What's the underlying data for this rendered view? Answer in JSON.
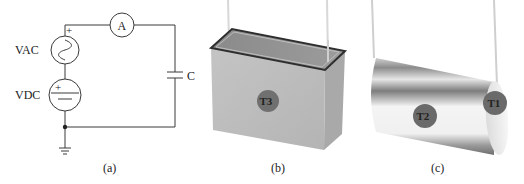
{
  "figure": {
    "panels": [
      {
        "id": "a",
        "caption": "(a)",
        "description": "circuit schematic",
        "labels": {
          "vac": "VAC",
          "vdc": "VDC",
          "ammeter": "A",
          "capacitor": "C",
          "vac_polarity": "+",
          "vdc_polarity": "+"
        },
        "components": [
          "ac-voltage-source",
          "dc-voltage-source",
          "ammeter",
          "capacitor",
          "ground"
        ]
      },
      {
        "id": "b",
        "caption": "(b)",
        "description": "box-type capacitor",
        "marker": "T3"
      },
      {
        "id": "c",
        "caption": "(c)",
        "description": "cylindrical capacitor",
        "markers": [
          "T2",
          "T1"
        ]
      }
    ],
    "colors": {
      "line": "#3a3a3a",
      "box_front": "#bdbdbd",
      "box_side": "#a8a8a8",
      "box_top": "#8e8e8e",
      "marker_fill": "#6f6f6f",
      "cylinder_light": "#f2f2f2",
      "cylinder_dark": "#9a9a9a"
    }
  }
}
